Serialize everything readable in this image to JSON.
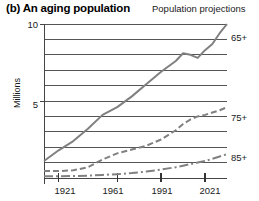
{
  "header": {
    "title": "(b) An aging population",
    "subtitle": "Population projections"
  },
  "axis": {
    "ylabel": "Millions",
    "ytick_labels": [
      "10",
      "5"
    ],
    "xtick_labels": [
      "1921",
      "1961",
      "1991",
      "2021"
    ]
  },
  "series_labels": {
    "s65": "65+",
    "s75": "75+",
    "s85": "85+"
  },
  "chart_data": {
    "type": "line",
    "title": "(b) An aging population",
    "subtitle": "Population projections",
    "xlabel": "",
    "ylabel": "Millions",
    "xlim": [
      1911,
      2036
    ],
    "ylim": [
      0,
      10
    ],
    "yticks": [
      5,
      10
    ],
    "xticks": [
      1921,
      1961,
      1991,
      2021
    ],
    "grid": true,
    "gridlines_y": [
      1,
      2,
      3,
      4,
      5,
      6,
      7,
      8,
      9,
      10
    ],
    "legend_position": "right-inline",
    "series": [
      {
        "name": "65+",
        "label": "65+",
        "style": "solid",
        "color": "#808080",
        "x": [
          1911,
          1921,
          1931,
          1941,
          1951,
          1961,
          1971,
          1981,
          1991,
          2001,
          2006,
          2011,
          2016,
          2021,
          2026,
          2031,
          2036
        ],
        "values": [
          1.1,
          1.8,
          2.4,
          3.2,
          4.1,
          4.6,
          5.3,
          6.1,
          6.9,
          7.6,
          8.1,
          8.0,
          7.8,
          8.3,
          8.7,
          9.4,
          10.0
        ]
      },
      {
        "name": "75+",
        "label": "75+",
        "style": "dashed",
        "color": "#808080",
        "x": [
          1911,
          1921,
          1931,
          1941,
          1951,
          1961,
          1971,
          1981,
          1991,
          2001,
          2006,
          2011,
          2016,
          2021,
          2026,
          2031,
          2036
        ],
        "values": [
          0.45,
          0.45,
          0.5,
          0.7,
          1.2,
          1.6,
          1.85,
          2.1,
          2.5,
          3.1,
          3.5,
          3.8,
          4.0,
          4.1,
          4.25,
          4.4,
          4.6
        ]
      },
      {
        "name": "85+",
        "label": "85+",
        "style": "dashdot",
        "color": "#808080",
        "x": [
          1911,
          1921,
          1931,
          1941,
          1951,
          1961,
          1971,
          1981,
          1991,
          2001,
          2006,
          2011,
          2016,
          2021,
          2026,
          2031,
          2036
        ],
        "values": [
          0.12,
          0.12,
          0.13,
          0.15,
          0.2,
          0.25,
          0.32,
          0.42,
          0.55,
          0.7,
          0.8,
          0.9,
          1.0,
          1.1,
          1.25,
          1.4,
          1.55
        ]
      }
    ]
  }
}
